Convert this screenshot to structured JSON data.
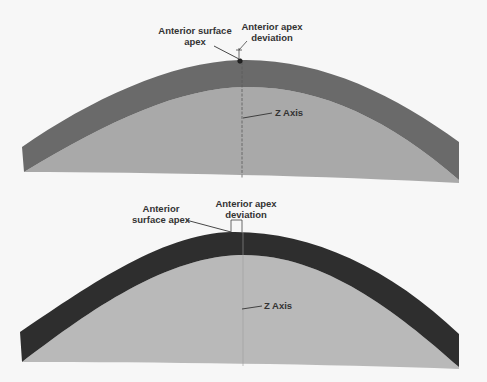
{
  "figure": {
    "background": "#f7f7f7",
    "colors": {
      "top_shell": "#6a6a6a",
      "top_inner": "#a9a9a9",
      "bottom_shell": "#2e2e2e",
      "bottom_inner": "#b9b9b9",
      "axis_line": "#555555",
      "label_text": "#333333"
    }
  },
  "top_diagram": {
    "apex_label_line1": "Anterior surface",
    "apex_label_line2": "apex",
    "deviation_label_line1": "Anterior apex",
    "deviation_label_line2": "deviation",
    "axis_label": "Z Axis"
  },
  "bottom_diagram": {
    "apex_label_line1": "Anterior",
    "apex_label_line2": "surface apex",
    "deviation_label_line1": "Anterior apex",
    "deviation_label_line2": "deviation",
    "axis_label": "Z Axis"
  }
}
